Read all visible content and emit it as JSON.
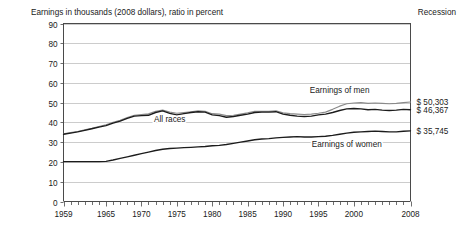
{
  "chart_data": {
    "type": "line",
    "title": "Earnings in thousands (2008 dollars), ratio in percent",
    "legend_header": "Recession",
    "xlabel": "",
    "ylabel": "",
    "xlim": [
      1959,
      2008
    ],
    "ylim": [
      0,
      90
    ],
    "yticks": [
      0,
      10,
      20,
      30,
      40,
      50,
      60,
      70,
      80,
      90
    ],
    "ytick_labels": [
      "0",
      "10",
      "20",
      "30",
      "40",
      "50",
      "60",
      "70",
      "80",
      "90"
    ],
    "xticks": [
      1959,
      1965,
      1970,
      1975,
      1980,
      1985,
      1990,
      1995,
      2000,
      2008
    ],
    "xtick_labels": [
      "1959",
      "1965",
      "1970",
      "1975",
      "1980",
      "1985",
      "1990",
      "1995",
      "2000",
      "2008"
    ],
    "grid": true,
    "grid_axis": "y",
    "legend_position": "inline-annotations",
    "x": [
      1959,
      1960,
      1961,
      1962,
      1963,
      1964,
      1965,
      1966,
      1967,
      1968,
      1969,
      1970,
      1971,
      1972,
      1973,
      1974,
      1975,
      1976,
      1977,
      1978,
      1979,
      1980,
      1981,
      1982,
      1983,
      1984,
      1985,
      1986,
      1987,
      1988,
      1989,
      1990,
      1991,
      1992,
      1993,
      1994,
      1995,
      1996,
      1997,
      1998,
      1999,
      2000,
      2001,
      2002,
      2003,
      2004,
      2005,
      2006,
      2007,
      2008
    ],
    "series": [
      {
        "name": "Earnings of men",
        "color": "#8a8a8a",
        "label": "Earnings of men",
        "end_value_label": "$ 50,303",
        "values": [
          34.2,
          34.8,
          35.4,
          36.2,
          37.0,
          37.9,
          38.8,
          40.0,
          41.0,
          42.4,
          43.6,
          44.0,
          44.3,
          45.6,
          46.2,
          45.2,
          44.6,
          45.0,
          45.4,
          45.8,
          45.6,
          44.4,
          44.2,
          43.4,
          43.6,
          44.2,
          44.8,
          45.6,
          45.6,
          45.6,
          45.9,
          44.8,
          44.4,
          44.2,
          44.0,
          44.2,
          44.6,
          45.2,
          46.6,
          48.2,
          49.4,
          49.8,
          50.0,
          49.6,
          49.8,
          49.6,
          49.4,
          49.6,
          50.0,
          50.3
        ]
      },
      {
        "name": "All races",
        "color": "#1c1c1c",
        "label": "All races",
        "end_value_label": "$ 46,367",
        "values": [
          34.0,
          34.6,
          35.2,
          36.0,
          36.8,
          37.6,
          38.4,
          39.6,
          40.6,
          42.0,
          43.2,
          43.4,
          43.6,
          45.0,
          45.8,
          44.6,
          43.8,
          44.4,
          45.0,
          45.4,
          45.2,
          43.8,
          43.4,
          42.6,
          43.0,
          43.6,
          44.2,
          45.0,
          45.2,
          45.2,
          45.4,
          44.2,
          43.6,
          43.2,
          43.0,
          43.2,
          43.8,
          44.2,
          45.0,
          46.0,
          46.8,
          47.0,
          46.8,
          46.4,
          46.6,
          46.2,
          46.0,
          46.2,
          46.6,
          46.4
        ]
      },
      {
        "name": "Earnings of women",
        "color": "#1c1c1c",
        "label": "Earnings of women",
        "end_value_label": "$ 35,745",
        "values": [
          20.2,
          20.2,
          20.2,
          20.2,
          20.2,
          20.2,
          20.3,
          21.0,
          21.8,
          22.6,
          23.4,
          24.2,
          25.0,
          25.8,
          26.4,
          26.8,
          27.0,
          27.2,
          27.4,
          27.6,
          27.8,
          28.2,
          28.4,
          28.8,
          29.4,
          30.0,
          30.6,
          31.2,
          31.6,
          31.8,
          32.2,
          32.4,
          32.6,
          32.8,
          32.6,
          32.6,
          32.8,
          33.0,
          33.4,
          34.0,
          34.6,
          35.0,
          35.2,
          35.4,
          35.6,
          35.4,
          35.2,
          35.2,
          35.5,
          35.7
        ]
      }
    ],
    "annotations": [
      {
        "text": "All races",
        "x": 1974,
        "y": 41.5
      },
      {
        "text": "Earnings of men",
        "x": 1998,
        "y": 56.5
      },
      {
        "text": "Earnings of women",
        "x": 1999,
        "y": 29.0
      }
    ],
    "end_labels": [
      {
        "text": "$ 50,303",
        "series": "Earnings of men"
      },
      {
        "text": "$ 46,367",
        "series": "All races"
      },
      {
        "text": "$ 35,745",
        "series": "Earnings of women"
      }
    ]
  }
}
